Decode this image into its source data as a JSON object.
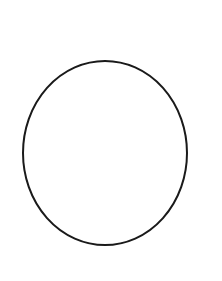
{
  "canvas": {
    "width": 222,
    "height": 281,
    "background": "#ffffff"
  },
  "shape": {
    "type": "ellipse",
    "cx": 105,
    "cy": 153,
    "rx": 82,
    "ry": 92,
    "stroke": "#1a1a1a",
    "stroke_width": 2,
    "fill": "none"
  }
}
